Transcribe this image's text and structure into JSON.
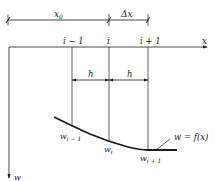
{
  "diagram": {
    "dimensions": {
      "x0_label": "x",
      "x0_sub": "0",
      "dx_label": "Δx",
      "h_label_1": "h",
      "h_label_2": "h"
    },
    "axis": {
      "x_label": "x",
      "w_label": "w",
      "nodes": [
        "i − 1",
        "i",
        "i + 1"
      ]
    },
    "curve": {
      "equation": "w = f(x)",
      "points": [
        {
          "base": "w",
          "sub": "i − 1"
        },
        {
          "base": "w",
          "sub": "i"
        },
        {
          "base": "w",
          "sub": "i + 1"
        }
      ]
    },
    "colors": {
      "line": "#1a1a1a",
      "background": "#ffffff"
    }
  }
}
